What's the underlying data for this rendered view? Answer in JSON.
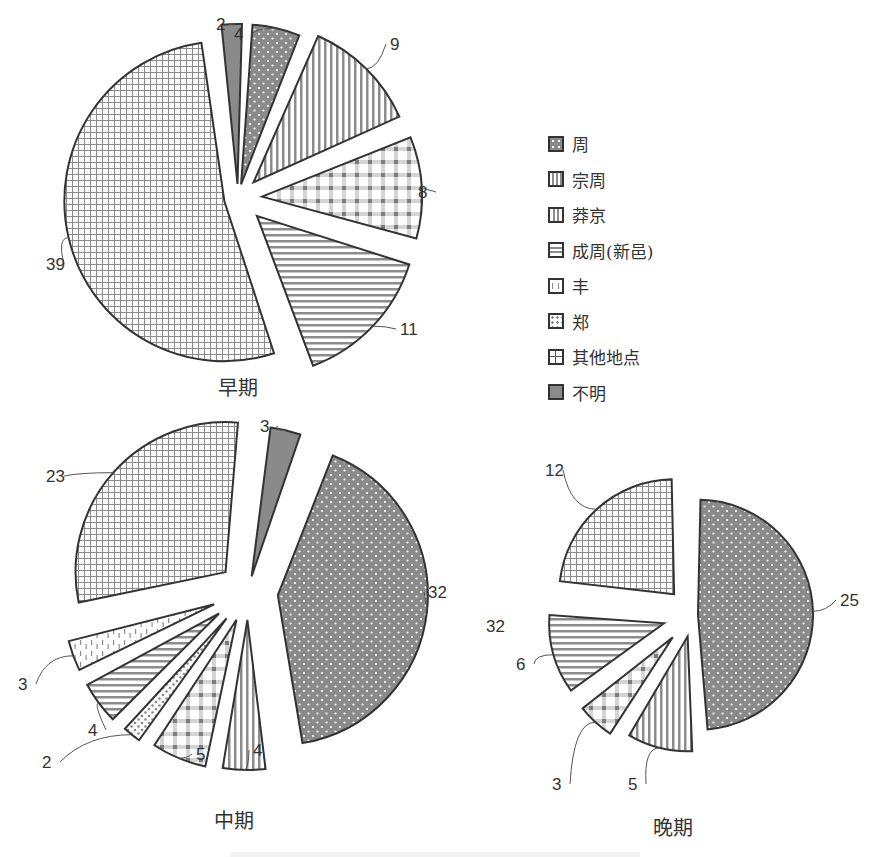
{
  "legend": {
    "items": [
      {
        "key": "zhou",
        "label": "周",
        "pattern": "dots-dark"
      },
      {
        "key": "zongzhou",
        "label": "宗周",
        "pattern": "gingham"
      },
      {
        "key": "pangjing",
        "label": "莽京",
        "pattern": "vertical-stripes"
      },
      {
        "key": "chengzhou",
        "label": "成周(新邑)",
        "pattern": "horizontal-stripes"
      },
      {
        "key": "feng",
        "label": "丰",
        "pattern": "dashes"
      },
      {
        "key": "zheng",
        "label": "郑",
        "pattern": "dots-light"
      },
      {
        "key": "other",
        "label": "其他地点",
        "pattern": "grid"
      },
      {
        "key": "unknown",
        "label": "不明",
        "pattern": "solid-gray"
      }
    ]
  },
  "titles": {
    "early": "早期",
    "middle": "中期",
    "late": "晚期"
  },
  "colors": {
    "stroke": "#333333",
    "dark_fill": "#8a8a8a",
    "pattern_line": "#8c8c8c",
    "background": "#ffffff"
  },
  "chart_data": [
    {
      "type": "pie",
      "title": "早期",
      "categories": [
        "不明",
        "周",
        "莽京",
        "宗周",
        "成周(新邑)",
        "其他地点"
      ],
      "values": [
        2,
        4,
        9,
        8,
        11,
        39
      ],
      "total": 73
    },
    {
      "type": "pie",
      "title": "中期",
      "categories": [
        "不明",
        "周",
        "莽京",
        "宗周",
        "郑",
        "成周(新邑)",
        "丰",
        "其他地点"
      ],
      "values": [
        3,
        32,
        4,
        5,
        2,
        4,
        3,
        23
      ],
      "total": 76
    },
    {
      "type": "pie",
      "title": "晚期",
      "categories": [
        "周",
        "莽京",
        "宗周",
        "成周(新邑)",
        "其他地点"
      ],
      "values": [
        25,
        5,
        3,
        6,
        12
      ],
      "total": 51,
      "annotations": [
        "32 (stray label near 成周 slice)"
      ]
    }
  ]
}
